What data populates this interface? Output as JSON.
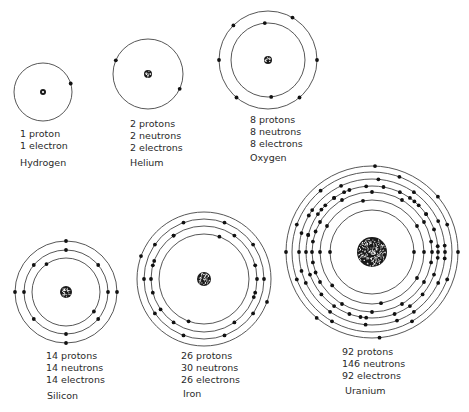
{
  "atoms": [
    {
      "name": "Hydrogen",
      "protons_text": "1 proton",
      "neutrons_text": "",
      "electrons_text": "1 electron",
      "center": [
        43,
        92
      ],
      "nucleus_r": 3,
      "shells": [
        {
          "r": 29,
          "electron_angles": [
            -17
          ]
        }
      ]
    },
    {
      "name": "Helium",
      "protons_text": "2 protons",
      "neutrons_text": "2 neutrons",
      "electrons_text": "2 electrons",
      "center": [
        148,
        74
      ],
      "nucleus_r": 4,
      "shells": [
        {
          "r": 35,
          "electron_angles": [
            203,
            25
          ]
        }
      ]
    },
    {
      "name": "Oxygen",
      "protons_text": "8 protons",
      "neutrons_text": "8 neutrons",
      "electrons_text": "8 electrons",
      "center": [
        268,
        60
      ],
      "nucleus_r": 4,
      "shells": [
        {
          "r": 37,
          "electron_angles": [
            -95,
            85
          ]
        },
        {
          "r": 49,
          "electron_angles": [
            -60,
            -135,
            0,
            180,
            50,
            130
          ]
        }
      ]
    },
    {
      "name": "Silicon",
      "protons_text": "14 protons",
      "neutrons_text": "14 neutrons",
      "electrons_text": "14 electrons",
      "center": [
        66,
        292
      ],
      "nucleus_r": 6,
      "shells": [
        {
          "r": 34,
          "electron_angles": [
            -125,
            35
          ]
        },
        {
          "r": 42,
          "electron_angles": [
            -90,
            -140,
            180,
            0,
            40,
            90,
            140,
            -40
          ]
        },
        {
          "r": 51,
          "electron_angles": [
            -90,
            180,
            0,
            90
          ]
        }
      ]
    },
    {
      "name": "Iron",
      "protons_text": "26 protons",
      "neutrons_text": "30 neutrons",
      "electrons_text": "26 electrons",
      "center": [
        204,
        279
      ],
      "nucleus_r": 7,
      "shells": [
        {
          "r": 45,
          "electron_angles": [
            -70,
            110
          ]
        },
        {
          "r": 53,
          "electron_angles": [
            -125,
            -55,
            -15,
            15,
            55,
            125,
            165,
            195,
            235,
            180,
            0,
            -160,
            20,
            145
          ]
        },
        {
          "r": 60,
          "electron_angles": [
            -110,
            -70,
            -145,
            -35,
            180,
            0,
            145,
            35,
            110,
            70
          ]
        },
        {
          "r": 67,
          "electron_angles": [
            -160,
            20
          ]
        }
      ]
    },
    {
      "name": "Uranium",
      "protons_text": "92 protons",
      "neutrons_text": "146 neutrons",
      "electrons_text": "92 electrons",
      "center": [
        372,
        252
      ],
      "nucleus_r": 15,
      "shells": [
        {
          "r": 42,
          "electron_angles": [
            180,
            0
          ]
        },
        {
          "r": 52,
          "electron_angles": [
            -100,
            -150,
            180,
            -30,
            0,
            30,
            80,
            140
          ]
        },
        {
          "r": 60,
          "electron_angles": [
            -120,
            -90,
            -60,
            -150,
            -30,
            180,
            0,
            150,
            30,
            120,
            90,
            60,
            -170,
            -10,
            170,
            10,
            200,
            -200
          ]
        },
        {
          "r": 66,
          "electron_angles": [
            -110,
            -80,
            -50,
            -140,
            -20,
            180,
            0,
            160,
            20,
            140,
            40,
            110,
            70,
            -165,
            -5,
            195,
            5,
            -95,
            95,
            125,
            55,
            -125,
            -35,
            215,
            225,
            235,
            245,
            295,
            305,
            315,
            325,
            100
          ]
        },
        {
          "r": 73,
          "electron_angles": [
            -115,
            -85,
            -55,
            -145,
            -25,
            180,
            0,
            155,
            25,
            125,
            55,
            95,
            70,
            -165,
            -5,
            165,
            5,
            210
          ]
        },
        {
          "r": 80,
          "electron_angles": [
            -130,
            -70,
            -160,
            -20,
            160,
            20,
            120,
            60
          ]
        },
        {
          "r": 86,
          "electron_angles": [
            -88,
            -40,
            180,
            0,
            130,
            85
          ]
        }
      ]
    }
  ],
  "labels": [
    {
      "atom": "Hydrogen",
      "x": 20,
      "y": 128,
      "lines": [
        "1 proton",
        "1 electron"
      ],
      "name_x": 20,
      "name_y": 157
    },
    {
      "atom": "Helium",
      "x": 130,
      "y": 118,
      "lines": [
        "2 protons",
        "2 neutrons",
        "2 electrons"
      ],
      "name_x": 130,
      "name_y": 157
    },
    {
      "atom": "Oxygen",
      "x": 250,
      "y": 114,
      "lines": [
        "8 protons",
        "8 neutrons",
        "8 electrons"
      ],
      "name_x": 250,
      "name_y": 152
    },
    {
      "atom": "Silicon",
      "x": 46,
      "y": 350,
      "lines": [
        "14 protons",
        "14 neutrons",
        "14 electrons"
      ],
      "name_x": 47,
      "name_y": 390
    },
    {
      "atom": "Iron",
      "x": 181,
      "y": 350,
      "lines": [
        "26 protons",
        "30 neutrons",
        "26 electrons"
      ],
      "name_x": 183,
      "name_y": 388
    },
    {
      "atom": "Uranium",
      "x": 342,
      "y": 346,
      "lines": [
        "92 protons",
        "146 neutrons",
        "92 electrons"
      ],
      "name_x": 345,
      "name_y": 385
    }
  ],
  "colors": {
    "orbit": "#444444",
    "electron": "#111111",
    "nucleus": "#1a1a1a",
    "text": "#2a2a2a",
    "background": "#ffffff"
  }
}
